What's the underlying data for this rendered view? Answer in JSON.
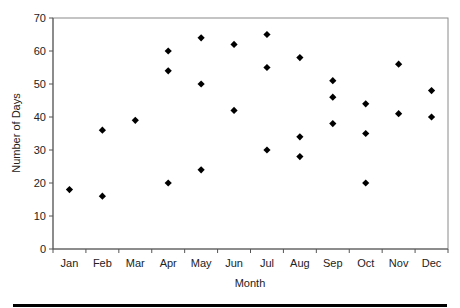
{
  "chart_data": {
    "type": "scatter",
    "title": "",
    "xlabel": "Month",
    "ylabel": "Number of Days",
    "categories": [
      "Jan",
      "Feb",
      "Mar",
      "Apr",
      "May",
      "Jun",
      "Jul",
      "Aug",
      "Sep",
      "Oct",
      "Nov",
      "Dec"
    ],
    "ylim": [
      0,
      70
    ],
    "yticks": [
      0,
      10,
      20,
      30,
      40,
      50,
      60,
      70
    ],
    "grid": false,
    "legend": null,
    "marker": "diamond",
    "marker_color": "#000000",
    "points": [
      {
        "x": "Jan",
        "y": 18
      },
      {
        "x": "Feb",
        "y": 36
      },
      {
        "x": "Feb",
        "y": 16
      },
      {
        "x": "Mar",
        "y": 39
      },
      {
        "x": "Apr",
        "y": 60
      },
      {
        "x": "Apr",
        "y": 54
      },
      {
        "x": "Apr",
        "y": 20
      },
      {
        "x": "May",
        "y": 64
      },
      {
        "x": "May",
        "y": 50
      },
      {
        "x": "May",
        "y": 24
      },
      {
        "x": "Jun",
        "y": 62
      },
      {
        "x": "Jun",
        "y": 42
      },
      {
        "x": "Jul",
        "y": 65
      },
      {
        "x": "Jul",
        "y": 55
      },
      {
        "x": "Jul",
        "y": 30
      },
      {
        "x": "Aug",
        "y": 58
      },
      {
        "x": "Aug",
        "y": 34
      },
      {
        "x": "Aug",
        "y": 28
      },
      {
        "x": "Sep",
        "y": 51
      },
      {
        "x": "Sep",
        "y": 46
      },
      {
        "x": "Sep",
        "y": 38
      },
      {
        "x": "Oct",
        "y": 44
      },
      {
        "x": "Oct",
        "y": 35
      },
      {
        "x": "Oct",
        "y": 20
      },
      {
        "x": "Nov",
        "y": 56
      },
      {
        "x": "Nov",
        "y": 41
      },
      {
        "x": "Dec",
        "y": 48
      },
      {
        "x": "Dec",
        "y": 40
      }
    ]
  },
  "axes": {
    "x_title": "Month",
    "y_title": "Number of Days"
  }
}
